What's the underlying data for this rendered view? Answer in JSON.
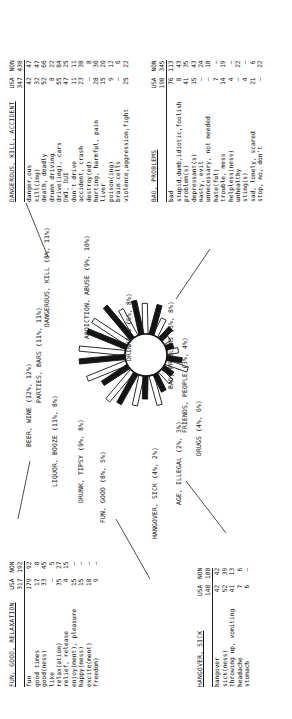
{
  "figure": {
    "type": "radial-sunburst-with-tables",
    "orientation": "rotated-90-ccw"
  },
  "columns": {
    "term": "",
    "usa": "USA",
    "non": "NON"
  },
  "categories": [
    {
      "name": "BEER, WINE",
      "usa_pct": "12%",
      "non_pct": "12%",
      "label": "BEER, WINE (12%, 12%)"
    },
    {
      "name": "PARTIES, BARS",
      "usa_pct": "11%",
      "non_pct": "11%",
      "label": "PARTIES, BARS (11%, 11%)"
    },
    {
      "name": "LIQUOR, BOOZE",
      "usa_pct": "11%",
      "non_pct": "8%",
      "label": "LIQUOR, BOOZE (11%, 8%)"
    },
    {
      "name": "DRUNK, TIPSY",
      "usa_pct": "9%",
      "non_pct": "8%",
      "label": "DRUNK, TIPSY (9%, 8%)"
    },
    {
      "name": "FUN, GOOD",
      "usa_pct": "8%",
      "non_pct": "5%",
      "label": "FUN, GOOD (8%, 5%)"
    },
    {
      "name": "HANGOVER, SICK",
      "usa_pct": "4%",
      "non_pct": "2%",
      "label": "HANGOVER, SICK (4%, 2%)"
    },
    {
      "name": "AGE, ILLEGAL",
      "usa_pct": "2%",
      "non_pct": "3%",
      "label": "AGE, ILLEGAL (2%, 3%)"
    },
    {
      "name": "DRUGS",
      "usa_pct": "4%",
      "non_pct": "6%",
      "label": "DRUGS (4%, 6%)"
    },
    {
      "name": "FRIENDS, PEOPLE",
      "usa_pct": "3%",
      "non_pct": "4%",
      "label": "FRIENDS, PEOPLE (3%, 4%)"
    },
    {
      "name": "BAD, PROBLEMS",
      "usa_pct": "5%",
      "non_pct": "8%",
      "label": "BAD, PROBLEMS (5%, 8%)"
    },
    {
      "name": "DRINKING",
      "usa_pct": "6%",
      "non_pct": "8%",
      "label": "DRINKING (6%, 8%)"
    },
    {
      "name": "ADDICTION, ABUSE",
      "usa_pct": "9%",
      "non_pct": "10%",
      "label": "ADDICTION, ABUSE (9%, 10%)"
    },
    {
      "name": "DANGEROUS, KILL",
      "usa_pct": "8%",
      "non_pct": "11%",
      "label": "DANGEROUS, KILL (8%, 11%)"
    }
  ],
  "tables": [
    {
      "id": "dangerous-kill-accident",
      "title": "DANGEROUS, KILL, ACCIDENT",
      "totals": {
        "usa": "347",
        "non": "438"
      },
      "rows": [
        {
          "term": "danger,ous",
          "usa": "42",
          "non": "47"
        },
        {
          "term": "kill(ing)",
          "usa": "32",
          "non": "47"
        },
        {
          "term": "death, deadly",
          "usa": "52",
          "non": "66"
        },
        {
          "term": "drunk driving",
          "usa": "8",
          "non": "22"
        },
        {
          "term": "drive(ing), cars",
          "usa": "55",
          "non": "84"
        },
        {
          "term": "DWI, DUI",
          "usa": "47",
          "non": "25"
        },
        {
          "term": "don't drive",
          "usa": "11",
          "non": "11"
        },
        {
          "term": "accident, crash",
          "usa": "23",
          "non": "38"
        },
        {
          "term": "destroy(ed)",
          "usa": "–",
          "non": "8"
        },
        {
          "term": "hurting, harmful, pain",
          "usa": "28",
          "non": "30"
        },
        {
          "term": "liver",
          "usa": "15",
          "non": "20"
        },
        {
          "term": "poison(ing)",
          "usa": "9",
          "non": "12"
        },
        {
          "term": "brain cells",
          "usa": "–",
          "non": "6"
        },
        {
          "term": "violence,aggression,fight",
          "usa": "25",
          "non": "22"
        }
      ]
    },
    {
      "id": "bad-problems",
      "title": "BAD, PROBLEMS",
      "totals": {
        "usa": "190",
        "non": "345"
      },
      "rows": [
        {
          "term": "bad",
          "usa": "76",
          "non": "113"
        },
        {
          "term": "stupid,dumb,idiotic,foolish",
          "usa": "8",
          "non": "43"
        },
        {
          "term": "problem(s)",
          "usa": "41",
          "non": "35"
        },
        {
          "term": "depressant(s)",
          "usa": "15",
          "non": "43"
        },
        {
          "term": "nasty, evil",
          "usa": "–",
          "non": "24"
        },
        {
          "term": "unnecessary, not needed",
          "usa": "–",
          "non": "18"
        },
        {
          "term": "hate(ful)",
          "usa": "7",
          "non": "–"
        },
        {
          "term": "trouble, mess",
          "usa": "14",
          "non": "19"
        },
        {
          "term": "helpless(ness)",
          "usa": "4",
          "non": "–"
        },
        {
          "term": "unhealthy",
          "usa": "–",
          "non": "22"
        },
        {
          "term": "sting(s)",
          "usa": "4",
          "non": "–"
        },
        {
          "term": "sad, lonely, scared",
          "usa": "21",
          "non": "6"
        },
        {
          "term": "stop, no, don't",
          "usa": "–",
          "non": "22"
        }
      ]
    },
    {
      "id": "fun-good-relaxation",
      "title": "FUN, GOOD, RELAXATION",
      "totals": {
        "usa": "317",
        "non": "192"
      },
      "rows": [
        {
          "term": "fun",
          "usa": "179",
          "non": "92"
        },
        {
          "term": "good times",
          "usa": "17",
          "non": "8"
        },
        {
          "term": "good(ness)",
          "usa": "33",
          "non": "45"
        },
        {
          "term": "like",
          "usa": "–",
          "non": "5"
        },
        {
          "term": "relax(ation)",
          "usa": "35",
          "non": "27"
        },
        {
          "term": "relief, release",
          "usa": "4",
          "non": "15"
        },
        {
          "term": "enjoy(ment), pleasure",
          "usa": "15",
          "non": "–"
        },
        {
          "term": "happy(ness)",
          "usa": "15",
          "non": "–"
        },
        {
          "term": "excite(ment)",
          "usa": "10",
          "non": "–"
        },
        {
          "term": "freedom)",
          "usa": "9",
          "non": "–"
        }
      ]
    },
    {
      "id": "hangover-sick",
      "title": "HANGOVER, SICK",
      "totals": {
        "usa": "148",
        "non": "100"
      },
      "rows": [
        {
          "term": "hangover",
          "usa": "42",
          "non": "42"
        },
        {
          "term": "sick(ness)",
          "usa": "52",
          "non": "39"
        },
        {
          "term": "throwing up, vomiting",
          "usa": "41",
          "non": "13"
        },
        {
          "term": "headache",
          "usa": "7",
          "non": "6"
        },
        {
          "term": "stomach",
          "usa": "6",
          "non": "–"
        }
      ]
    }
  ],
  "burst": {
    "inner_radius": 21,
    "description": "13 paired radial bars, black = USA, white/outlined = NON",
    "usa_color": "#141414",
    "non_color": "#ffffff",
    "outline_color": "#141414",
    "petals": [
      {
        "cat": "BEER, WINE",
        "usa": 12,
        "non": 12
      },
      {
        "cat": "PARTIES, BARS",
        "usa": 11,
        "non": 11
      },
      {
        "cat": "LIQUOR, BOOZE",
        "usa": 11,
        "non": 8
      },
      {
        "cat": "DRUNK, TIPSY",
        "usa": 9,
        "non": 8
      },
      {
        "cat": "FUN, GOOD",
        "usa": 8,
        "non": 5
      },
      {
        "cat": "HANGOVER, SICK",
        "usa": 4,
        "non": 2
      },
      {
        "cat": "AGE, ILLEGAL",
        "usa": 2,
        "non": 3
      },
      {
        "cat": "DRUGS",
        "usa": 4,
        "non": 6
      },
      {
        "cat": "FRIENDS, PEOPLE",
        "usa": 3,
        "non": 4
      },
      {
        "cat": "BAD, PROBLEMS",
        "usa": 5,
        "non": 8
      },
      {
        "cat": "DRINKING",
        "usa": 6,
        "non": 8
      },
      {
        "cat": "ADDICTION, ABUSE",
        "usa": 9,
        "non": 10
      },
      {
        "cat": "DANGEROUS, KILL",
        "usa": 8,
        "non": 11
      }
    ]
  }
}
